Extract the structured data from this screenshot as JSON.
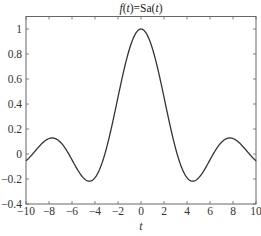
{
  "chart_data": {
    "type": "line",
    "title": "f(t)=Sa(t)",
    "title_parts": [
      {
        "text": "f",
        "italic": true
      },
      {
        "text": "(",
        "italic": false
      },
      {
        "text": "t",
        "italic": true
      },
      {
        "text": ")=Sa(",
        "italic": false
      },
      {
        "text": "t",
        "italic": true
      },
      {
        "text": ")",
        "italic": false
      }
    ],
    "xlabel": "t",
    "ylabel": "",
    "xlim": [
      -10,
      10
    ],
    "ylim": [
      -0.4,
      1.1
    ],
    "grid": false,
    "legend": null,
    "x_ticks": [
      -10,
      -8,
      -6,
      -4,
      -2,
      0,
      2,
      4,
      6,
      8,
      10
    ],
    "x_tick_labels": [
      "−10",
      "−8",
      "−6",
      "−4",
      "−2",
      "0",
      "2",
      "4",
      "6",
      "8",
      "10"
    ],
    "y_ticks": [
      -0.4,
      -0.2,
      0,
      0.2,
      0.4,
      0.6,
      0.8,
      1
    ],
    "y_tick_labels": [
      "−0.4",
      "−0.2",
      "0",
      "0.2",
      "0.4",
      "0.6",
      "0.8",
      "1"
    ],
    "series": [
      {
        "name": "Sa(t) = sin(t)/t",
        "color": "#333333",
        "function": "sin(t)/t",
        "x": [
          -10,
          -9,
          -8,
          -7.725,
          -7,
          -6,
          -5,
          -4.493,
          -4,
          -3,
          -2,
          -1,
          0,
          1,
          2,
          3,
          4,
          4.493,
          5,
          6,
          7,
          7.725,
          8,
          9,
          10
        ],
        "values": [
          -0.054,
          0.046,
          0.124,
          0.128,
          0.094,
          0.047,
          -0.192,
          -0.217,
          -0.189,
          0.047,
          0.455,
          0.841,
          1.0,
          0.841,
          0.455,
          0.047,
          -0.189,
          -0.217,
          -0.192,
          -0.047,
          0.094,
          0.128,
          0.124,
          0.046,
          -0.054
        ]
      }
    ]
  }
}
